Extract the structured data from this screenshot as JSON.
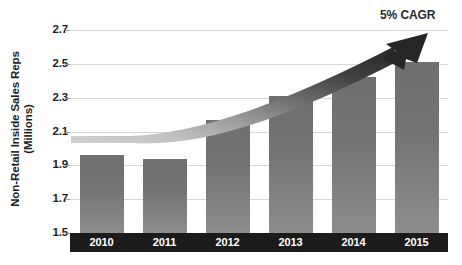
{
  "chart_data": {
    "type": "bar",
    "title": "",
    "xlabel": "",
    "ylabel_line1": "Non-Retail Inside Sales Reps",
    "ylabel_line2": "(Millions)",
    "categories": [
      "2010",
      "2011",
      "2012",
      "2013",
      "2014",
      "2015"
    ],
    "values": [
      1.96,
      1.94,
      2.17,
      2.31,
      2.42,
      2.51
    ],
    "ylim": [
      1.5,
      2.7
    ],
    "yticks": [
      "1.5",
      "1.7",
      "1.9",
      "2.1",
      "2.3",
      "2.5",
      "2.7"
    ],
    "ytick_values": [
      1.5,
      1.7,
      1.9,
      2.1,
      2.3,
      2.5,
      2.7
    ],
    "grid": true,
    "legend": "none",
    "annotations": [
      {
        "name": "cagr-annotation",
        "text": "5% CAGR",
        "type": "curved-arrow",
        "description": "Dark gradient curved arrow rising left-to-right from 2.1 level to above 2.7"
      }
    ],
    "series": [
      {
        "name": "Non-Retail Inside Sales Reps",
        "values": [
          1.96,
          1.94,
          2.17,
          2.31,
          2.42,
          2.51
        ]
      }
    ]
  },
  "colors": {
    "bar_top": "#6f6f6f",
    "bar_bottom": "#8d8d8d",
    "gridline": "#d7d7d7",
    "axis_band": "#1b1b1b",
    "axis_band_text": "#ffffff",
    "text": "#201d1c",
    "arrow_dark": "#2f2f2f",
    "arrow_light": "#c9c9c9",
    "background": "#ffffff"
  }
}
